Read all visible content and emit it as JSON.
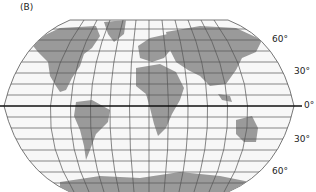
{
  "figure": {
    "panel_label": "(B)",
    "projection": "pseudocylindrical world map (Robinson-like) with 30° meridians and 10° parallels",
    "colors": {
      "land": "#9a9a9a",
      "ocean": "#f7f7f7",
      "grid": "#555555",
      "equator": "#111111"
    }
  },
  "latitude_labels": [
    {
      "text": "60°",
      "lat": 60
    },
    {
      "text": "30°",
      "lat": 30
    },
    {
      "text": "0°",
      "lat": 0
    },
    {
      "text": "30°",
      "lat": -30
    },
    {
      "text": "60°",
      "lat": -60
    }
  ],
  "landmasses": [
    "North America",
    "South America",
    "Europe",
    "Africa",
    "Asia",
    "Australia",
    "Antarctica",
    "Greenland"
  ]
}
